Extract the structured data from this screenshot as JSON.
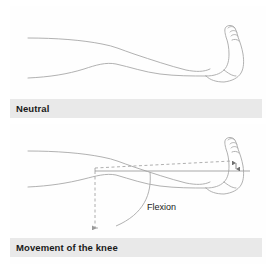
{
  "figure": {
    "title": "Movement of the knee",
    "line_color": "#a8a8a8",
    "dash_color": "#9a9a9a",
    "band_color": "#e9e9e9",
    "text_color": "#1a1a1a",
    "background": "#ffffff"
  },
  "panels": [
    {
      "id": "neutral",
      "caption": "Neutral",
      "description": "Leg shown horizontal with foot upright"
    },
    {
      "id": "flexion",
      "caption": "Movement of the knee",
      "description": "Leg with knee bending, dashed reference lines and arrows"
    }
  ],
  "annotations": {
    "flexion_label": "Flexion",
    "angle_marker": "",
    "arrow_down_label": "",
    "reference_line_label": ""
  }
}
